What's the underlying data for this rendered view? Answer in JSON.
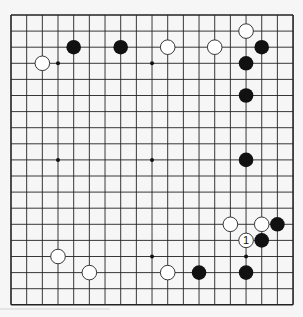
{
  "board": {
    "size": 19,
    "origin_x": 11,
    "origin_y": 15,
    "spacing_x": 15.67,
    "spacing_y": 16.1,
    "line_color": "#222222",
    "background": "#f6f6f6",
    "star_points": [
      [
        3,
        3
      ],
      [
        9,
        3
      ],
      [
        15,
        3
      ],
      [
        3,
        9
      ],
      [
        9,
        9
      ],
      [
        15,
        9
      ],
      [
        3,
        15
      ],
      [
        9,
        15
      ],
      [
        15,
        15
      ]
    ],
    "stones": [
      {
        "col": 15,
        "row": 1,
        "color": "white"
      },
      {
        "col": 4,
        "row": 2,
        "color": "black"
      },
      {
        "col": 7,
        "row": 2,
        "color": "black"
      },
      {
        "col": 10,
        "row": 2,
        "color": "white"
      },
      {
        "col": 13,
        "row": 2,
        "color": "white"
      },
      {
        "col": 16,
        "row": 2,
        "color": "black"
      },
      {
        "col": 2,
        "row": 3,
        "color": "white"
      },
      {
        "col": 15,
        "row": 3,
        "color": "black"
      },
      {
        "col": 15,
        "row": 5,
        "color": "black"
      },
      {
        "col": 15,
        "row": 9,
        "color": "black"
      },
      {
        "col": 14,
        "row": 13,
        "color": "white"
      },
      {
        "col": 16,
        "row": 13,
        "color": "white"
      },
      {
        "col": 17,
        "row": 13,
        "color": "black"
      },
      {
        "col": 15,
        "row": 14,
        "color": "white",
        "label": "1"
      },
      {
        "col": 16,
        "row": 14,
        "color": "black"
      },
      {
        "col": 3,
        "row": 15,
        "color": "white"
      },
      {
        "col": 5,
        "row": 16,
        "color": "white"
      },
      {
        "col": 10,
        "row": 16,
        "color": "white"
      },
      {
        "col": 12,
        "row": 16,
        "color": "black"
      },
      {
        "col": 15,
        "row": 16,
        "color": "black"
      }
    ]
  }
}
